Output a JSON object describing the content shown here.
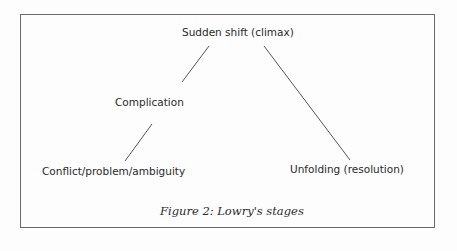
{
  "figure": {
    "caption": "Figure 2: Lowry's stages",
    "nodes": {
      "climax": "Sudden shift (climax)",
      "complication": "Complication",
      "conflict": "Conflict/problem/ambiguity",
      "resolution": "Unfolding (resolution)"
    }
  }
}
